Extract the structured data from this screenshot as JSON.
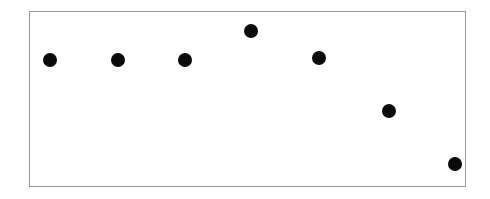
{
  "figure": {
    "background_color": "#ffffff",
    "width": 490,
    "height": 199
  },
  "plot_frame": {
    "name": "plot-border",
    "left": 29,
    "top": 11,
    "width": 437,
    "height": 176,
    "border_color": "#9a9a9a",
    "border_width": 1,
    "fill_color": "#ffffff"
  },
  "chart_data": {
    "type": "scatter",
    "title": "",
    "subtitle": "",
    "xlabel": "",
    "ylabel": "",
    "grid": false,
    "legend": null,
    "legend_position": "none",
    "annotations": [],
    "xtick_labels": [],
    "ytick_labels": [],
    "xlim": [
      0,
      7
    ],
    "ylim": [
      0,
      7
    ],
    "marker": {
      "shape": "circle",
      "color": "#0a0a0a",
      "size_px": 14
    },
    "series": [
      {
        "name": "series-1",
        "color": "#0a0a0a",
        "x": [
          0,
          1,
          2,
          3,
          4,
          5,
          6
        ],
        "y": [
          4.9,
          4.9,
          4.9,
          6.0,
          5.0,
          3.0,
          1.4
        ],
        "points": [
          {
            "label": "point-1",
            "cx": 50,
            "cy": 60,
            "r": 7
          },
          {
            "label": "point-2",
            "cx": 118,
            "cy": 60,
            "r": 7
          },
          {
            "label": "point-3",
            "cx": 185,
            "cy": 60,
            "r": 7
          },
          {
            "label": "point-4",
            "cx": 251,
            "cy": 31,
            "r": 7
          },
          {
            "label": "point-5",
            "cx": 319,
            "cy": 58,
            "r": 7
          },
          {
            "label": "point-6",
            "cx": 389,
            "cy": 111,
            "r": 7
          },
          {
            "label": "point-7",
            "cx": 455,
            "cy": 164,
            "r": 7
          }
        ]
      }
    ]
  }
}
